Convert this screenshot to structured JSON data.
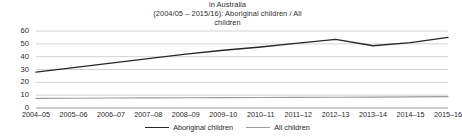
{
  "title": {
    "line1": "in Australia",
    "line2": "(2004/05 – 2015/16): Aboriginal children / All",
    "line3": "children"
  },
  "legend": {
    "items": [
      {
        "label": "Aboriginal children",
        "color": "#262626"
      },
      {
        "label": "All children",
        "color": "#9a9a9a"
      }
    ]
  },
  "axis": {
    "y_ticks": [
      "0",
      "10",
      "20",
      "30",
      "40",
      "50",
      "60"
    ],
    "x_ticks": [
      "2004–05",
      "2005–06",
      "2006–07",
      "2007–08",
      "2008–09",
      "2009–10",
      "2010–11",
      "2011–12",
      "2012–13",
      "2013–14",
      "2014–15",
      "2015–16"
    ]
  },
  "chart_data": {
    "type": "line",
    "title": "in Australia (2004/05 – 2015/16): Aboriginal children / All children",
    "xlabel": "",
    "ylabel": "",
    "ylim": [
      0,
      60
    ],
    "yticks": [
      0,
      10,
      20,
      30,
      40,
      50,
      60
    ],
    "grid": true,
    "legend_position": "bottom-center",
    "categories": [
      "2004–05",
      "2005–06",
      "2006–07",
      "2007–08",
      "2008–09",
      "2009–10",
      "2010–11",
      "2011–12",
      "2012–13",
      "2013–14",
      "2014–15",
      "2015–16"
    ],
    "series": [
      {
        "name": "Aboriginal children",
        "color": "#262626",
        "values": [
          28,
          31.5,
          35,
          38.5,
          42,
          45,
          47.5,
          50.5,
          53.5,
          48.5,
          51,
          55
        ]
      },
      {
        "name": "All children",
        "color": "#9a9a9a",
        "values": [
          7.5,
          7.6,
          7.8,
          7.9,
          8.0,
          8.1,
          8.2,
          8.3,
          8.4,
          8.5,
          8.7,
          8.9
        ]
      }
    ]
  }
}
